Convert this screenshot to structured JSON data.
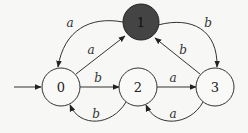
{
  "diagram": {
    "type": "finite-automaton",
    "colors": {
      "background": "#f7f7f5",
      "stroke": "#333333",
      "accept_fill": "#444444"
    },
    "start_state": "0",
    "states": [
      {
        "id": "0",
        "label": "0",
        "x": 61,
        "y": 87,
        "accepting": false
      },
      {
        "id": "1",
        "label": "1",
        "x": 141,
        "y": 22,
        "accepting": true
      },
      {
        "id": "2",
        "label": "2",
        "x": 138,
        "y": 87,
        "accepting": false
      },
      {
        "id": "3",
        "label": "3",
        "x": 215,
        "y": 87,
        "accepting": false
      }
    ],
    "transitions": [
      {
        "from": "1",
        "to": "0",
        "label": "a"
      },
      {
        "from": "0",
        "to": "1",
        "label": "a"
      },
      {
        "from": "1",
        "to": "3",
        "label": "b"
      },
      {
        "from": "3",
        "to": "1",
        "label": "b"
      },
      {
        "from": "0",
        "to": "2",
        "label": "b"
      },
      {
        "from": "2",
        "to": "0",
        "label": "b"
      },
      {
        "from": "2",
        "to": "3",
        "label": "a"
      },
      {
        "from": "3",
        "to": "2",
        "label": "a"
      }
    ]
  }
}
